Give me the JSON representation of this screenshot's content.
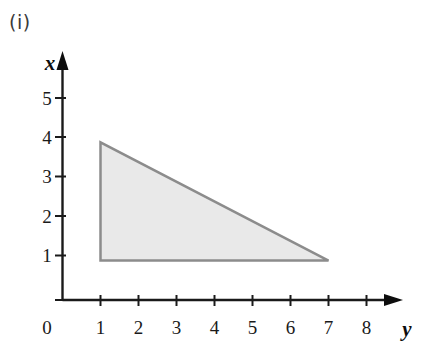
{
  "figure": {
    "part_label": "(i)",
    "background_color": "#ffffff"
  },
  "axes": {
    "vertical_axis_name": "x",
    "horizontal_axis_name": "y",
    "origin_label": "0",
    "vertical_ticks": [
      "1",
      "2",
      "3",
      "4",
      "5"
    ],
    "horizontal_ticks": [
      "1",
      "2",
      "3",
      "4",
      "5",
      "6",
      "7",
      "8"
    ],
    "axis_color": "#1a1a1a"
  },
  "chart_data": {
    "type": "scatter",
    "title": "(i)",
    "xlabel": "y",
    "ylabel": "x",
    "xlim": [
      0,
      8.9
    ],
    "ylim": [
      0,
      5.7
    ],
    "xticks": [
      1,
      2,
      3,
      4,
      5,
      6,
      7,
      8
    ],
    "yticks": [
      1,
      2,
      3,
      4,
      5
    ],
    "grid": false,
    "legend": null,
    "shapes": [
      {
        "name": "shaded-triangle-region",
        "kind": "polygon",
        "vertices": [
          [
            1,
            4
          ],
          [
            1,
            1
          ],
          [
            7,
            1
          ]
        ],
        "fill": "#e9e9e9",
        "stroke": "#8c8c8c",
        "stroke_width": 2.5
      }
    ],
    "annotations": [
      {
        "text": "(i)",
        "x": 0.1,
        "y": 5.6
      }
    ]
  }
}
